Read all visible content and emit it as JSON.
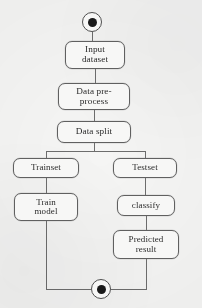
{
  "diagram": {
    "type": "uml-activity-diagram",
    "background_color": "#fbfbfa",
    "stroke_color": "#5d5d5d",
    "text_color": "#1d1d1d",
    "node_fill": "#fdfdfc"
  },
  "nodes": {
    "start": {
      "name": "start-node",
      "label": "",
      "shape": "filled-circle-in-circle",
      "x": 82,
      "y": 12,
      "size": 20
    },
    "input_dataset": {
      "label": "Input\ndataset",
      "x": 65,
      "y": 41,
      "w": 60,
      "h": 28,
      "font_size": 9.2
    },
    "data_preprocess": {
      "label": "Data pre-\nprocess",
      "x": 58,
      "y": 83,
      "w": 72,
      "h": 27,
      "font_size": 9.2
    },
    "data_split": {
      "label": "Data split",
      "x": 57,
      "y": 121,
      "w": 74,
      "h": 22,
      "font_size": 9.2
    },
    "trainset": {
      "label": "Trainset",
      "x": 13,
      "y": 158,
      "w": 66,
      "h": 20,
      "font_size": 9.0
    },
    "testset": {
      "label": "Testset",
      "x": 113,
      "y": 158,
      "w": 64,
      "h": 20,
      "font_size": 9.0
    },
    "train_model": {
      "label": "Train\nmodel",
      "x": 14,
      "y": 193,
      "w": 64,
      "h": 28,
      "font_size": 9.0
    },
    "classify": {
      "label": "classify",
      "x": 117,
      "y": 195,
      "w": 58,
      "h": 21,
      "font_size": 9.0
    },
    "predicted_result": {
      "label": "Predicted\nresult",
      "x": 113,
      "y": 230,
      "w": 66,
      "h": 29,
      "font_size": 9.0
    },
    "end": {
      "name": "end-node",
      "label": "",
      "shape": "filled-circle-in-circle",
      "x": 91,
      "y": 279,
      "size": 20
    }
  },
  "edges": [
    {
      "name": "start-to-input",
      "from": "start",
      "to": "input_dataset"
    },
    {
      "name": "input-to-preprocess",
      "from": "input_dataset",
      "to": "data_preprocess"
    },
    {
      "name": "preprocess-to-split",
      "from": "data_preprocess",
      "to": "data_split"
    },
    {
      "name": "split-fork",
      "from": "data_split",
      "to": "fork-bar"
    },
    {
      "name": "fork-to-trainset",
      "from": "fork-bar",
      "to": "trainset"
    },
    {
      "name": "fork-to-testset",
      "from": "fork-bar",
      "to": "testset"
    },
    {
      "name": "trainset-to-train-model",
      "from": "trainset",
      "to": "train_model"
    },
    {
      "name": "testset-to-classify",
      "from": "testset",
      "to": "classify"
    },
    {
      "name": "classify-to-predicted-result",
      "from": "classify",
      "to": "predicted_result"
    },
    {
      "name": "train-model-to-end",
      "from": "train_model",
      "to": "end"
    },
    {
      "name": "predicted-result-to-end",
      "from": "predicted_result",
      "to": "end"
    }
  ]
}
